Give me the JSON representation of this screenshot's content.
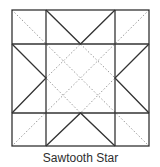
{
  "diagram": {
    "title": "Sawtooth Star",
    "colors": {
      "solid_line": "#333333",
      "dotted_line": "#9a9a9a",
      "background": "#ffffff"
    },
    "block": {
      "x0": 12,
      "y0": 10,
      "x1": 149,
      "y1": 146,
      "grid": "3x3",
      "solid_lines": [
        "outer square",
        "two vertical grid lines",
        "two horizontal grid lines",
        "8 flying-geese diagonals forming star points"
      ],
      "dotted_lines": [
        "two full-block diagonals",
        "center diamond connecting star-point tips"
      ]
    }
  }
}
